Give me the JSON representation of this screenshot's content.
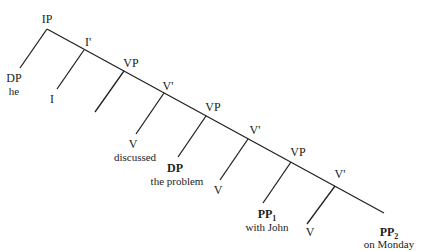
{
  "diagram": {
    "type": "syntax-tree",
    "nodes": [
      {
        "id": "ip",
        "label": "IP",
        "x": 47,
        "y": 13
      },
      {
        "id": "dp-he",
        "label": "DP",
        "x": 14,
        "y": 72
      },
      {
        "id": "he",
        "label": "he",
        "x": 14,
        "y": 86,
        "word": true
      },
      {
        "id": "ibar",
        "label": "I'",
        "x": 88,
        "y": 36
      },
      {
        "id": "i",
        "label": "I",
        "x": 52,
        "y": 93
      },
      {
        "id": "vp1",
        "label": "VP",
        "x": 131,
        "y": 57
      },
      {
        "id": "vbar1",
        "label": "V'",
        "x": 168,
        "y": 80
      },
      {
        "id": "v1",
        "label": "V",
        "x": 133,
        "y": 138
      },
      {
        "id": "discussed",
        "label": "discussed",
        "x": 135,
        "y": 152,
        "word": true
      },
      {
        "id": "vp2",
        "label": "VP",
        "x": 213,
        "y": 101
      },
      {
        "id": "dp",
        "label": "DP",
        "x": 175,
        "y": 162,
        "bold": true
      },
      {
        "id": "the-problem",
        "label": "the problem",
        "x": 177,
        "y": 176,
        "word": true
      },
      {
        "id": "vbar2",
        "label": "V'",
        "x": 255,
        "y": 124
      },
      {
        "id": "v2",
        "label": "V",
        "x": 218,
        "y": 184
      },
      {
        "id": "vp3",
        "label": "VP",
        "x": 298,
        "y": 146
      },
      {
        "id": "pp1",
        "label": "PP",
        "sub": "1",
        "x": 267,
        "y": 208,
        "bold": true
      },
      {
        "id": "with-john",
        "label": "with John",
        "x": 267,
        "y": 222,
        "word": true
      },
      {
        "id": "vbar3",
        "label": "V'",
        "x": 340,
        "y": 168
      },
      {
        "id": "v3",
        "label": "V",
        "x": 310,
        "y": 226
      },
      {
        "id": "pp2",
        "label": "PP",
        "sub": "2",
        "x": 389,
        "y": 226,
        "bold": true
      },
      {
        "id": "on-monday",
        "label": "on Monday",
        "x": 389,
        "y": 239,
        "word": true
      }
    ],
    "spine": [
      [
        47,
        29
      ],
      [
        384,
        213
      ]
    ],
    "branches": [
      [
        47,
        29,
        20,
        68
      ],
      [
        84,
        50,
        57,
        89
      ],
      [
        124,
        71,
        95,
        112
      ],
      [
        164,
        93,
        136,
        134
      ],
      [
        206,
        116,
        178,
        157
      ],
      [
        248,
        139,
        220,
        180
      ],
      [
        291,
        162,
        263,
        203
      ],
      [
        335,
        186,
        307,
        224
      ]
    ],
    "line_color": "#222222"
  }
}
